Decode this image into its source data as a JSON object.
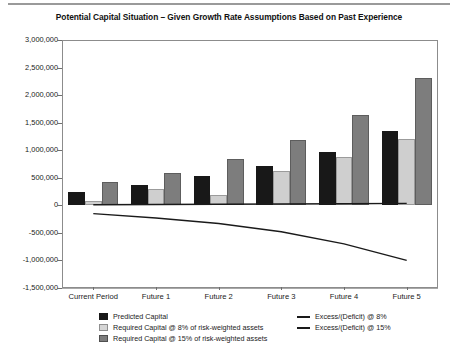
{
  "chart_data": {
    "type": "bar",
    "title": "Potential Capital Situation – Given Growth Rate Assumptions Based on Past Experience",
    "xlabel": "",
    "ylabel": "",
    "ylim": [
      -1500000,
      3000000
    ],
    "ytick_step": 500000,
    "grid": true,
    "legend_position": "bottom",
    "categories": [
      "Current Period",
      "Future 1",
      "Future 2",
      "Future 3",
      "Future 4",
      "Future 5"
    ],
    "ytick_labels": [
      "3,000,000",
      "2,500,000",
      "2,000,000",
      "1,500,000",
      "1,000,000",
      "500,000",
      "0",
      "-500,000",
      "-1,000,000",
      "-1,500,000"
    ],
    "ytick_values": [
      3000000,
      2500000,
      2000000,
      1500000,
      1000000,
      500000,
      0,
      -500000,
      -1000000,
      -1500000
    ],
    "series": [
      {
        "name": "Predicted Capital",
        "kind": "bar",
        "color": "#181818",
        "values": [
          250000,
          370000,
          530000,
          710000,
          970000,
          1350000
        ]
      },
      {
        "name": "Required Capital @ 8% of risk-weighted assets",
        "kind": "bar",
        "color": "#cfcfcf",
        "values": [
          80000,
          300000,
          180000,
          620000,
          880000,
          1210000
        ]
      },
      {
        "name": "Required Capital @ 15% of risk-weighted assets",
        "kind": "bar",
        "color": "#7d7d7d",
        "values": [
          430000,
          580000,
          850000,
          1180000,
          1640000,
          2320000
        ]
      },
      {
        "name": "Excess/(Deficit) @ 8%",
        "kind": "line",
        "color": "#1a1a1a",
        "values": [
          10000,
          15000,
          20000,
          25000,
          30000,
          35000
        ]
      },
      {
        "name": "Excess/(Deficit) @ 15%",
        "kind": "line",
        "color": "#1a1a1a",
        "values": [
          -150000,
          -230000,
          -330000,
          -480000,
          -700000,
          -1000000
        ]
      }
    ]
  }
}
